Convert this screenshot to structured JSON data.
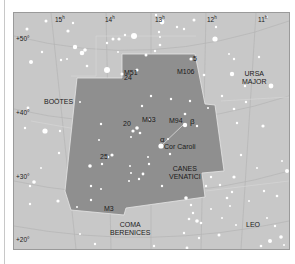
{
  "map": {
    "title": "Canes Venatici star chart",
    "colors": {
      "background": "#c8c8c8",
      "highlight_region": "#8f8f8f",
      "border": "#9a9a9a",
      "grid": "#b4b4b4",
      "stars": "#ffffff",
      "text": "#1a1a1a"
    },
    "right_ascension_labels": [
      {
        "value": "15",
        "unit": "h"
      },
      {
        "value": "14",
        "unit": "h"
      },
      {
        "value": "13",
        "unit": "h"
      },
      {
        "value": "12",
        "unit": "h"
      },
      {
        "value": "11",
        "unit": "h"
      }
    ],
    "declination_labels": [
      "+50°",
      "+40°",
      "+30°",
      "+20°"
    ],
    "constellations": [
      {
        "name": "BOÖTES"
      },
      {
        "name_line1": "URSA",
        "name_line2": "MAJOR"
      },
      {
        "name_line1": "CANES",
        "name_line2": "VENATICI"
      },
      {
        "name_line1": "COMA",
        "name_line2": "BERENICES"
      },
      {
        "name": "LEO"
      }
    ],
    "objects": {
      "m51": "M51",
      "m106": "M106",
      "m63": "M63",
      "m94": "M94",
      "m3": "M3",
      "star_5": "5",
      "star_24": "24",
      "star_20": "20",
      "star_25": "25",
      "alpha": "α",
      "beta": "β",
      "cor_caroli": "Cor Caroli"
    }
  }
}
